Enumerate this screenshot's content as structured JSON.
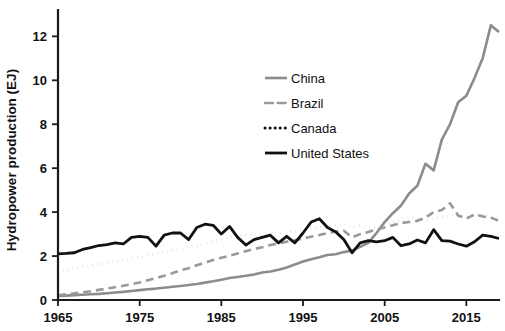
{
  "chart_data": {
    "type": "line",
    "title": "",
    "xlabel": "",
    "ylabel": "Hydropower production (EJ)",
    "xlim": [
      1965,
      2019
    ],
    "ylim": [
      0,
      13.2
    ],
    "grid": false,
    "legend_position": "upper-center",
    "xticks": [
      1965,
      1975,
      1985,
      1995,
      2005,
      2015
    ],
    "xtick_labels": [
      "1965",
      "1975",
      "1985",
      "1995",
      "2005",
      "2015"
    ],
    "yticks": [
      0,
      2,
      4,
      6,
      8,
      10,
      12
    ],
    "ytick_labels": [
      "0",
      "2",
      "4",
      "6",
      "8",
      "10",
      "12"
    ],
    "x": [
      1965,
      1966,
      1967,
      1968,
      1969,
      1970,
      1971,
      1972,
      1973,
      1974,
      1975,
      1976,
      1977,
      1978,
      1979,
      1980,
      1981,
      1982,
      1983,
      1984,
      1985,
      1986,
      1987,
      1988,
      1989,
      1990,
      1991,
      1992,
      1993,
      1994,
      1995,
      1996,
      1997,
      1998,
      1999,
      2000,
      2001,
      2002,
      2003,
      2004,
      2005,
      2006,
      2007,
      2008,
      2009,
      2010,
      2011,
      2012,
      2013,
      2014,
      2015,
      2016,
      2017,
      2018,
      2019
    ],
    "series": [
      {
        "name": "China",
        "color": "#8c8c8c",
        "style": "solid",
        "width": 2.6,
        "values": [
          0.18,
          0.2,
          0.22,
          0.24,
          0.26,
          0.28,
          0.31,
          0.34,
          0.37,
          0.41,
          0.45,
          0.49,
          0.52,
          0.56,
          0.6,
          0.64,
          0.68,
          0.73,
          0.79,
          0.85,
          0.92,
          1.0,
          1.05,
          1.1,
          1.16,
          1.25,
          1.3,
          1.38,
          1.48,
          1.62,
          1.75,
          1.86,
          1.95,
          2.05,
          2.08,
          2.18,
          2.25,
          2.42,
          2.6,
          3.05,
          3.55,
          3.95,
          4.3,
          4.85,
          5.2,
          6.2,
          5.9,
          7.3,
          8.0,
          9.0,
          9.3,
          10.1,
          11.0,
          12.5,
          12.2
        ]
      },
      {
        "name": "Brazil",
        "color": "#9a9a9a",
        "style": "dashed",
        "width": 2.6,
        "values": [
          0.22,
          0.26,
          0.3,
          0.35,
          0.4,
          0.46,
          0.52,
          0.58,
          0.65,
          0.72,
          0.8,
          0.9,
          1.0,
          1.1,
          1.22,
          1.35,
          1.45,
          1.58,
          1.7,
          1.82,
          1.92,
          2.02,
          2.12,
          2.22,
          2.32,
          2.4,
          2.5,
          2.58,
          2.65,
          2.72,
          2.8,
          2.88,
          2.96,
          3.05,
          3.12,
          3.15,
          2.85,
          3.0,
          3.1,
          3.2,
          3.3,
          3.4,
          3.5,
          3.55,
          3.6,
          3.75,
          4.0,
          4.1,
          4.4,
          3.85,
          3.7,
          3.9,
          3.8,
          3.75,
          3.6
        ]
      },
      {
        "name": "Canada",
        "color": "#111111",
        "style": "dotted",
        "width": 3.0,
        "values": [
          1.3,
          1.38,
          1.42,
          1.5,
          1.55,
          1.62,
          1.7,
          1.76,
          1.82,
          1.88,
          1.95,
          2.05,
          2.1,
          2.18,
          2.25,
          2.32,
          2.4,
          2.45,
          2.55,
          2.68,
          2.78,
          2.88,
          2.92,
          2.98,
          2.92,
          2.98,
          3.08,
          3.02,
          3.1,
          3.12,
          3.22,
          3.28,
          3.32,
          3.3,
          3.42,
          3.48,
          3.32,
          3.38,
          3.28,
          3.3,
          3.42,
          3.55,
          3.6,
          3.78,
          3.72,
          3.6,
          3.72,
          3.78,
          3.82,
          3.88,
          3.8,
          3.85,
          3.9,
          3.82,
          3.78
        ]
      },
      {
        "name": "United States",
        "color": "#111111",
        "style": "solid",
        "width": 2.8,
        "values": [
          2.1,
          2.12,
          2.15,
          2.3,
          2.38,
          2.48,
          2.52,
          2.6,
          2.55,
          2.85,
          2.9,
          2.85,
          2.45,
          2.95,
          3.05,
          3.05,
          2.75,
          3.3,
          3.45,
          3.4,
          3.0,
          3.35,
          2.85,
          2.5,
          2.75,
          2.85,
          2.95,
          2.6,
          2.9,
          2.6,
          3.05,
          3.55,
          3.7,
          3.3,
          3.1,
          2.75,
          2.15,
          2.6,
          2.7,
          2.65,
          2.7,
          2.85,
          2.47,
          2.55,
          2.73,
          2.6,
          3.2,
          2.7,
          2.68,
          2.55,
          2.45,
          2.65,
          2.95,
          2.9,
          2.8
        ]
      }
    ]
  },
  "legend": {
    "entries": [
      {
        "label": "China"
      },
      {
        "label": "Brazil"
      },
      {
        "label": "Canada"
      },
      {
        "label": "United States"
      }
    ]
  }
}
